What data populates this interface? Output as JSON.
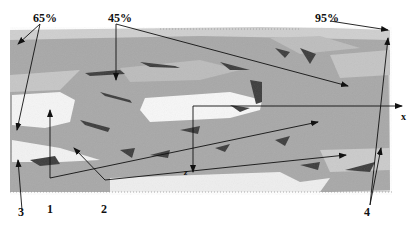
{
  "figure": {
    "caption_fragment": "……………",
    "labels": {
      "pct_65": "65%",
      "pct_45": "45%",
      "pct_95": "95%",
      "n1": "1",
      "n2": "2",
      "n3": "3",
      "n4": "4",
      "axis_x": "x",
      "axis_z": "z"
    },
    "colors": {
      "surface_gray": "#a9a9a9",
      "light_region": "#d4d4d4",
      "void_white": "#f7f7f7",
      "defect_dark": "#3a3a3a",
      "line": "#111111"
    }
  }
}
